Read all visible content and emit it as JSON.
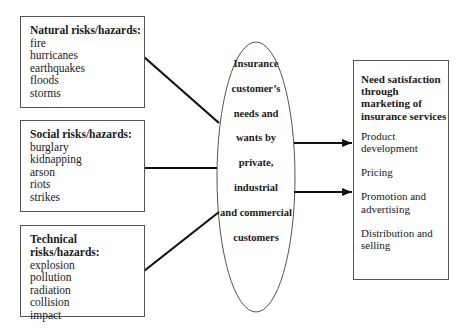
{
  "diagram": {
    "risk_groups": [
      {
        "title": "Natural risks/hazards:",
        "items": [
          "fire",
          "hurricanes",
          "earthquakes",
          "floods",
          "storms"
        ]
      },
      {
        "title": "Social risks/hazards:",
        "items": [
          "burglary",
          "kidnapping",
          "arson",
          "riots",
          "strikes"
        ]
      },
      {
        "title": "Technical risks/hazards:",
        "items": [
          "explosion",
          "pollution",
          "radiation",
          "collision",
          "impact"
        ]
      }
    ],
    "center": {
      "lines": [
        "Insurance",
        "customer’s",
        "needs and",
        "wants by",
        "private,",
        "industrial",
        "and commercial",
        "customers"
      ]
    },
    "outcome": {
      "title": "Need satisfaction through marketing of insurance services",
      "items": [
        "Product development",
        "Pricing",
        "Promotion and advertising",
        "Distribution and selling"
      ]
    },
    "colors": {
      "line": "#111111",
      "border": "#555555",
      "background": "#ffffff"
    }
  }
}
